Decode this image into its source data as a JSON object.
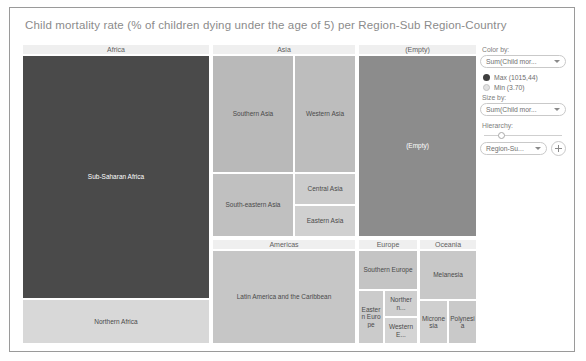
{
  "header": {
    "title": "Child mortality rate (% of children dying under the age of 5) per Region-Sub Region-Country"
  },
  "panel": {
    "color_by_label": "Color by:",
    "color_by_value": "Sum(Child mor...",
    "legend_max": "Max (1015,44)",
    "legend_min": "Min (3.70)",
    "size_by_label": "Size by:",
    "size_by_value": "Sum(Child mor...",
    "hierarchy_label": "Hierarchy:",
    "hierarchy_value": "Region-Su...",
    "add_label": "+"
  },
  "chart_data": {
    "type": "treemap",
    "title": "Child mortality rate (% of children dying under the age of 5) per Region-Sub Region-Country",
    "color_scale": {
      "max_label": "Max (1015,44)",
      "min_label": "Min (3.70)",
      "max_color": "#3f3f3f",
      "min_color": "#e2e2e2"
    },
    "groups": [
      {
        "name": "Africa",
        "x": 0,
        "y": 0,
        "w": 188,
        "h": 300,
        "children": [
          {
            "label": "Sub-Saharan Africa",
            "x": 0,
            "y": 0,
            "w": 188,
            "h": 244,
            "color": "#4a4a4a",
            "text": "light"
          },
          {
            "label": "Northern Africa",
            "x": 0,
            "y": 244,
            "w": 188,
            "h": 45,
            "color": "#d8d8d8",
            "text": "dark"
          }
        ]
      },
      {
        "name": "Asia",
        "x": 190,
        "y": 0,
        "w": 144,
        "h": 193,
        "children": [
          {
            "label": "Southern Asia",
            "x": 0,
            "y": 0,
            "w": 82,
            "h": 118,
            "color": "#b9b9b9",
            "text": "dark"
          },
          {
            "label": "Western Asia",
            "x": 82,
            "y": 0,
            "w": 62,
            "h": 118,
            "color": "#bdbdbd",
            "text": "dark"
          },
          {
            "label": "South-eastern Asia",
            "x": 0,
            "y": 118,
            "w": 82,
            "h": 64,
            "color": "#c0c0c0",
            "text": "dark"
          },
          {
            "label": "Central Asia",
            "x": 82,
            "y": 118,
            "w": 62,
            "h": 32,
            "color": "#cccccc",
            "text": "dark"
          },
          {
            "label": "Eastern Asia",
            "x": 82,
            "y": 150,
            "w": 62,
            "h": 32,
            "color": "#d0d0d0",
            "text": "dark"
          }
        ]
      },
      {
        "name": "(Empty)",
        "x": 336,
        "y": 0,
        "w": 119,
        "h": 193,
        "children": [
          {
            "label": "(Empty)",
            "x": 0,
            "y": 0,
            "w": 119,
            "h": 182,
            "color": "#8c8c8c",
            "text": "light"
          }
        ]
      },
      {
        "name": "Americas",
        "x": 190,
        "y": 195,
        "w": 144,
        "h": 105,
        "children": [
          {
            "label": "Latin America and the Caribbean",
            "x": 0,
            "y": 0,
            "w": 144,
            "h": 94,
            "color": "#c6c6c6",
            "text": "dark"
          }
        ]
      },
      {
        "name": "Europe",
        "x": 336,
        "y": 195,
        "w": 60,
        "h": 105,
        "children": [
          {
            "label": "Southern Europe",
            "x": 0,
            "y": 0,
            "w": 60,
            "h": 40,
            "color": "#c4c4c4",
            "text": "dark"
          },
          {
            "label": "Eastern Europe",
            "x": 0,
            "y": 40,
            "w": 26,
            "h": 54,
            "color": "#cbcbcb",
            "text": "dark"
          },
          {
            "label": "Northern...",
            "x": 26,
            "y": 40,
            "w": 34,
            "h": 27,
            "color": "#cfcfcf",
            "text": "dark"
          },
          {
            "label": "Western E...",
            "x": 26,
            "y": 67,
            "w": 34,
            "h": 27,
            "color": "#d4d4d4",
            "text": "dark"
          }
        ]
      },
      {
        "name": "Oceania",
        "x": 397,
        "y": 195,
        "w": 58,
        "h": 105,
        "children": [
          {
            "label": "Melanesia",
            "x": 0,
            "y": 0,
            "w": 58,
            "h": 50,
            "color": "#c8c8c8",
            "text": "dark"
          },
          {
            "label": "Micronesia",
            "x": 0,
            "y": 50,
            "w": 29,
            "h": 44,
            "color": "#cfcfcf",
            "text": "dark"
          },
          {
            "label": "Polynesia",
            "x": 29,
            "y": 50,
            "w": 29,
            "h": 44,
            "color": "#c9c9c9",
            "text": "dark"
          }
        ]
      }
    ]
  }
}
